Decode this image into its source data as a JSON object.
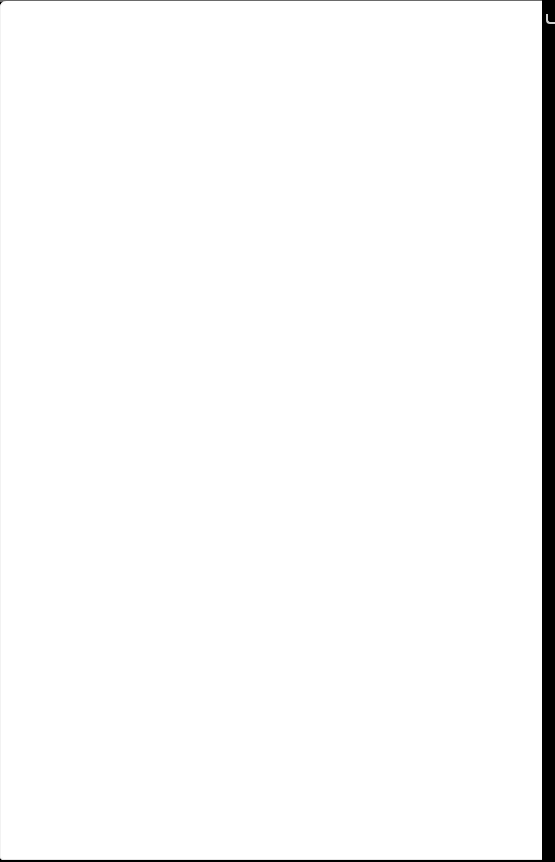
{
  "page": {
    "content": "",
    "background_color": "#ffffff",
    "frame_color": "#000000"
  }
}
